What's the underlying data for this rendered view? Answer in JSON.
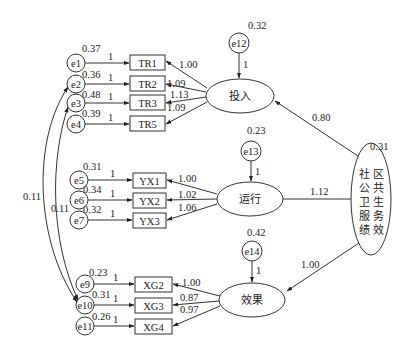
{
  "diagram": {
    "type": "structural-equation-model",
    "second_order_factor": {
      "id": "F",
      "label": "社区公共卫生服务绩效",
      "col1": [
        "社",
        "公",
        "卫",
        "服",
        "绩"
      ],
      "col2": [
        "区",
        "共",
        "生",
        "务",
        "效"
      ],
      "variance": "0.31"
    },
    "factors": [
      {
        "id": "F1",
        "label": "投入",
        "residual": "e12",
        "residual_variance": "0.32",
        "residual_path": "1",
        "path_from_F": "0.80"
      },
      {
        "id": "F2",
        "label": "运行",
        "residual": "e13",
        "residual_variance": "0.23",
        "residual_path": "1",
        "path_from_F": "1.12"
      },
      {
        "id": "F3",
        "label": "效果",
        "residual": "e14",
        "residual_variance": "0.42",
        "residual_path": "1",
        "path_from_F": "1.00"
      }
    ],
    "indicators": [
      {
        "name": "TR1",
        "factor": "F1",
        "loading": "1.00",
        "error": "e1",
        "error_variance": "0.37",
        "error_path": "1"
      },
      {
        "name": "TR2",
        "factor": "F1",
        "loading": "1.09",
        "error": "e2",
        "error_variance": "0.36",
        "error_path": "1"
      },
      {
        "name": "TR3",
        "factor": "F1",
        "loading": "1.13",
        "error": "e3",
        "error_variance": "0.48",
        "error_path": "1"
      },
      {
        "name": "TR5",
        "factor": "F1",
        "loading": "1.09",
        "error": "e4",
        "error_variance": "0.39",
        "error_path": "1"
      },
      {
        "name": "YX1",
        "factor": "F2",
        "loading": "1.00",
        "error": "e5",
        "error_variance": "0.31",
        "error_path": "1"
      },
      {
        "name": "YX2",
        "factor": "F2",
        "loading": "1.02",
        "error": "e6",
        "error_variance": "0.34",
        "error_path": "1"
      },
      {
        "name": "YX3",
        "factor": "F2",
        "loading": "1.06",
        "error": "e7",
        "error_variance": "0.32",
        "error_path": "1"
      },
      {
        "name": "XG2",
        "factor": "F3",
        "loading": "1.00",
        "error": "e9",
        "error_variance": "0.23",
        "error_path": "1"
      },
      {
        "name": "XG3",
        "factor": "F3",
        "loading": "0.87",
        "error": "e10",
        "error_variance": "0.31",
        "error_path": "1"
      },
      {
        "name": "XG4",
        "factor": "F3",
        "loading": "0.97",
        "error": "e11",
        "error_variance": "0.26",
        "error_path": "1"
      }
    ],
    "covariances": [
      {
        "from": "e2",
        "to": "e10",
        "value": "0.11"
      },
      {
        "from": "e3",
        "to": "e10",
        "value": "0.11"
      }
    ]
  }
}
